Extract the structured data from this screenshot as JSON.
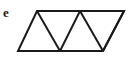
{
  "figure": {
    "label": "e",
    "label_name": "figure-label-e",
    "background_color": "#ffffff",
    "stroke_color": "#1a1a1a",
    "stroke_width": 2,
    "canvas": {
      "width": 140,
      "height": 64
    },
    "triangle_count": 5,
    "outline": {
      "name": "parallelogram-outline",
      "points": "37,11 124,11 103,51 18,51",
      "vertices": [
        {
          "name": "top-left",
          "x": 37,
          "y": 11
        },
        {
          "name": "top-right",
          "x": 124,
          "y": 11
        },
        {
          "name": "bottom-right",
          "x": 103,
          "y": 51
        },
        {
          "name": "bottom-left",
          "x": 18,
          "y": 51
        }
      ]
    },
    "top_edge": {
      "name": "top-edge",
      "x1": 37,
      "y1": 11,
      "x2": 124,
      "y2": 11
    },
    "bottom_edge": {
      "name": "bottom-edge",
      "x1": 18,
      "y1": 51,
      "x2": 103,
      "y2": 51
    },
    "left_edge": {
      "name": "left-slant-edge",
      "x1": 37,
      "y1": 11,
      "x2": 18,
      "y2": 51
    },
    "right_edge": {
      "name": "right-slant-edge",
      "x1": 124,
      "y1": 11,
      "x2": 103,
      "y2": 51
    },
    "diagonals": [
      {
        "name": "diagonal-1",
        "x1": 37,
        "y1": 11,
        "x2": 60,
        "y2": 51
      },
      {
        "name": "diagonal-2",
        "x1": 80,
        "y1": 11,
        "x2": 60,
        "y2": 51
      },
      {
        "name": "diagonal-3",
        "x1": 80,
        "y1": 11,
        "x2": 103,
        "y2": 51
      },
      {
        "name": "diagonal-4",
        "x1": 124,
        "y1": 11,
        "x2": 103,
        "y2": 51
      }
    ],
    "top_interior_vertices": [
      {
        "name": "top-apex-mid",
        "x": 80,
        "y": 11
      }
    ],
    "bottom_interior_vertices": [
      {
        "name": "bottom-apex-mid",
        "x": 60,
        "y": 51
      }
    ]
  }
}
